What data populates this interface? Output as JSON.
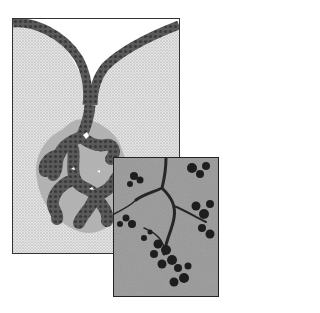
{
  "figure": {
    "panels": [
      {
        "id": "diagram",
        "kind": "schematic illustration",
        "subject": "branching tubuloacinar gland with duct opening at surface epithelium",
        "fill": "stippled connective tissue"
      },
      {
        "id": "micrograph",
        "kind": "light micrograph inset",
        "subject": "branched gland with dark-stained secretory acini"
      }
    ],
    "colors": {
      "background": "#ffffff",
      "stipple": "#c8c8c8",
      "epithelium": "#555555",
      "halo": "#a8a8a8",
      "micrograph_bg": "#9a9a9a",
      "micrograph_dark": "#1e1e1e"
    }
  }
}
